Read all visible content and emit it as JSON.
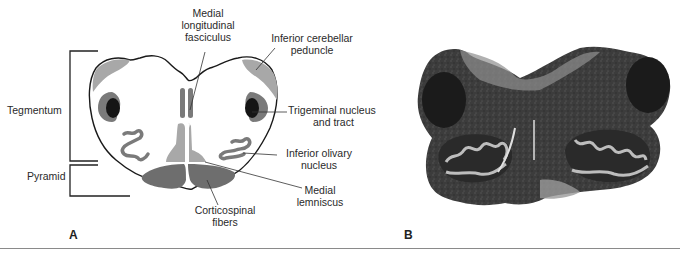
{
  "figure": {
    "panels": [
      {
        "letter": "A",
        "type": "schematic",
        "regions": {
          "tegmentum": "Tegmentum",
          "pyramid": "Pyramid"
        },
        "labels": {
          "mlf_line1": "Medial",
          "mlf_line2": "longitudinal",
          "mlf_line3": "fasciculus",
          "icp_line1": "Inferior cerebellar",
          "icp_line2": "peduncle",
          "trig_line1": "Trigeminal nucleus",
          "trig_line2": "and tract",
          "olive_line1": "Inferior olivary",
          "olive_line2": "nucleus",
          "ml_line1": "Medial",
          "ml_line2": "lemniscus",
          "cs_line1": "Corticospinal",
          "cs_line2": "fibers"
        }
      },
      {
        "letter": "B",
        "type": "histology-photo"
      }
    ],
    "colors": {
      "outline": "#1a1a1a",
      "light_gray": "#a8a8a8",
      "mid_gray": "#7a7a7a",
      "dark_gray": "#6a6a6a",
      "black_nucleus": "#151515",
      "pyramid_fill": "#6e6e6e"
    }
  }
}
